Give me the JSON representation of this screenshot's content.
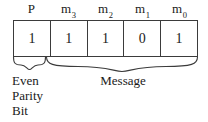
{
  "diagram": {
    "colors": {
      "line": "#3b3b3b",
      "text": "#1a1a1a",
      "background": "#ffffff"
    },
    "headers": [
      {
        "base": "P",
        "sub": ""
      },
      {
        "base": "m",
        "sub": "3"
      },
      {
        "base": "m",
        "sub": "2"
      },
      {
        "base": "m",
        "sub": "1"
      },
      {
        "base": "m",
        "sub": "0"
      }
    ],
    "bits": [
      "1",
      "1",
      "1",
      "0",
      "1"
    ],
    "brace_labels": {
      "parity": {
        "lines": [
          "Even",
          "Parity",
          "Bit"
        ]
      },
      "message": {
        "text": "Message"
      }
    }
  }
}
